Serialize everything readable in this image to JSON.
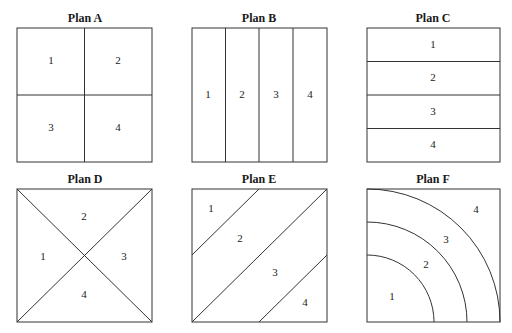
{
  "plans": [
    {
      "title": "Plan A",
      "type": "quadrants",
      "regions": [
        "1",
        "2",
        "3",
        "4"
      ]
    },
    {
      "title": "Plan B",
      "type": "vertical-strips",
      "regions": [
        "1",
        "2",
        "3",
        "4"
      ]
    },
    {
      "title": "Plan C",
      "type": "horizontal-strips",
      "regions": [
        "1",
        "2",
        "3",
        "4"
      ]
    },
    {
      "title": "Plan D",
      "type": "diagonal-triangles",
      "regions": [
        "1",
        "2",
        "3",
        "4"
      ]
    },
    {
      "title": "Plan E",
      "type": "diagonal-strips",
      "regions": [
        "1",
        "2",
        "3",
        "4"
      ]
    },
    {
      "title": "Plan F",
      "type": "concentric-quarter-arcs",
      "regions": [
        "1",
        "2",
        "3",
        "4"
      ]
    }
  ]
}
